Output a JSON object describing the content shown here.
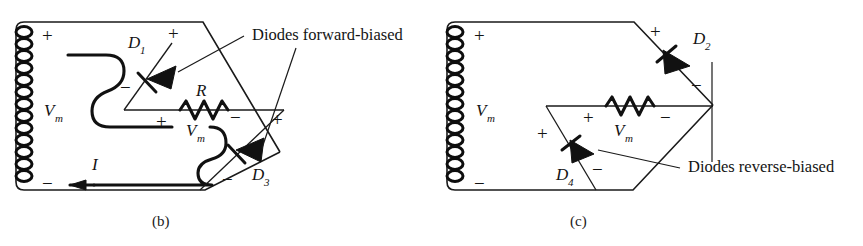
{
  "figure": {
    "title_semantic": "full-wave-bridge-rectifier-half-cycles",
    "panels": [
      {
        "id": "b",
        "caption": "(b)",
        "caption_x": 152,
        "caption_y": 226,
        "callout": "Diodes forward-biased",
        "callout_x": 252,
        "callout_y": 40,
        "source_label": "V",
        "source_sub": "m",
        "source_plus": "+",
        "source_minus": "−",
        "load_label": "R",
        "load_voltage_label": "V",
        "load_voltage_sub": "m",
        "current_label": "I",
        "diodes": [
          {
            "name": "D",
            "sub": "1",
            "plus": "+",
            "minus": "−"
          },
          {
            "name": "D",
            "sub": "3",
            "plus": "+",
            "minus": "−"
          }
        ]
      },
      {
        "id": "c",
        "caption": "(c)",
        "caption_x": 570,
        "caption_y": 226,
        "callout": "Diodes reverse-biased",
        "callout_x": 688,
        "callout_y": 172,
        "source_label": "V",
        "source_sub": "m",
        "source_plus": "+",
        "source_minus": "−",
        "load_label": "R",
        "load_voltage_label": "V",
        "load_voltage_sub": "m",
        "diodes": [
          {
            "name": "D",
            "sub": "2",
            "plus": "+",
            "minus": "−"
          },
          {
            "name": "D",
            "sub": "4",
            "plus": "+",
            "minus": "−"
          }
        ]
      }
    ],
    "colors": {
      "ink": "#1a1a1a",
      "background": "#ffffff",
      "diode_fill": "#111111"
    }
  }
}
